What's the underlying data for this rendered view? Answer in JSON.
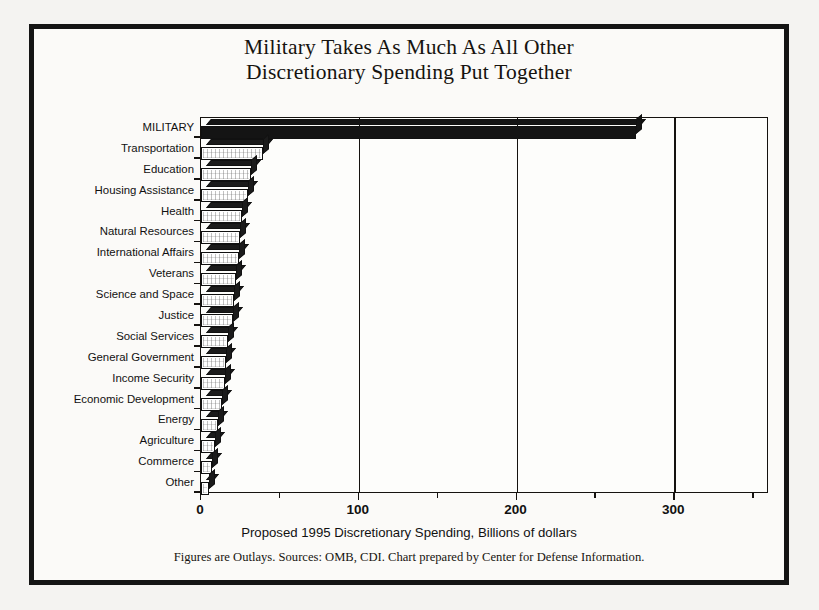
{
  "chart_data": {
    "type": "bar",
    "orientation": "horizontal",
    "title": "Military Takes As Much As All Other Discretionary Spending Put Together",
    "title_lines": [
      "Military Takes As Much As All Other",
      "Discretionary Spending Put Together"
    ],
    "xlabel": "Proposed 1995 Discretionary Spending, Billions of dollars",
    "ylabel": "",
    "footnote": "Figures are Outlays. Sources: OMB, CDI. Chart prepared by Center for Defense Information.",
    "xlim": [
      0,
      360
    ],
    "xticks": [
      0,
      100,
      200,
      300
    ],
    "xtick_labels": [
      "0",
      "100",
      "200",
      "300"
    ],
    "xticks_minor": [
      50,
      150,
      250,
      350
    ],
    "grid": "vertical gridlines at 100, 200, 300",
    "legend": "none",
    "categories": [
      "MILITARY",
      "Transportation",
      "Education",
      "Housing Assistance",
      "Health",
      "Natural Resources",
      "International Affairs",
      "Veterans",
      "Science and Space",
      "Justice",
      "Social Services",
      "General Government",
      "Income Security",
      "Economic Development",
      "Energy",
      "Agriculture",
      "Commerce",
      "Other"
    ],
    "values": [
      276,
      39,
      32,
      30,
      26,
      25,
      24,
      22,
      21,
      20,
      17,
      16,
      15,
      13,
      11,
      9,
      7,
      5
    ],
    "units": "Billions of dollars",
    "highlight_category": "MILITARY"
  },
  "colors": {
    "frame": "#141414",
    "background": "#fbfaf8",
    "bar_highlight": "#141414",
    "bar_face": "#ffffff",
    "bar_shadow": "#1b1b1b",
    "axis": "#15120f",
    "text": "#111111"
  }
}
